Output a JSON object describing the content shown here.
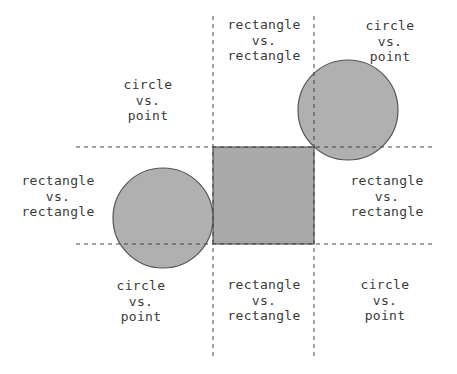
{
  "diagram": {
    "title": "",
    "colors": {
      "shape_fill": "#a9a9a9",
      "shape_stroke": "#555555",
      "dash_line": "#444444",
      "text": "#3a3a3a"
    },
    "shapes": {
      "square": {
        "x": 213,
        "y": 147,
        "w": 101,
        "h": 97
      },
      "circle_left": {
        "cx": 163,
        "cy": 218,
        "r": 50
      },
      "circle_right": {
        "cx": 348,
        "cy": 110,
        "r": 50
      }
    },
    "lines": {
      "vertical_left": {
        "x": 213,
        "y1": 16,
        "y2": 360
      },
      "vertical_right": {
        "x": 314,
        "y1": 16,
        "y2": 360
      },
      "horizontal_top": {
        "y": 147,
        "x1": 76,
        "x2": 432
      },
      "horizontal_bottom": {
        "y": 244,
        "x1": 76,
        "x2": 432
      }
    },
    "regions": [
      {
        "id": "top-left",
        "lines": [
          "circle",
          "vs.",
          "point"
        ]
      },
      {
        "id": "top-center",
        "lines": [
          "rectangle",
          "vs.",
          "rectangle"
        ]
      },
      {
        "id": "top-right",
        "lines": [
          "circle",
          "vs.",
          "point"
        ]
      },
      {
        "id": "middle-left",
        "lines": [
          "rectangle",
          "vs.",
          "rectangle"
        ]
      },
      {
        "id": "middle-right",
        "lines": [
          "rectangle",
          "vs.",
          "rectangle"
        ]
      },
      {
        "id": "bottom-left",
        "lines": [
          "circle",
          "vs.",
          "point"
        ]
      },
      {
        "id": "bottom-center",
        "lines": [
          "rectangle",
          "vs.",
          "rectangle"
        ]
      },
      {
        "id": "bottom-right",
        "lines": [
          "circle",
          "vs.",
          "point"
        ]
      }
    ]
  }
}
